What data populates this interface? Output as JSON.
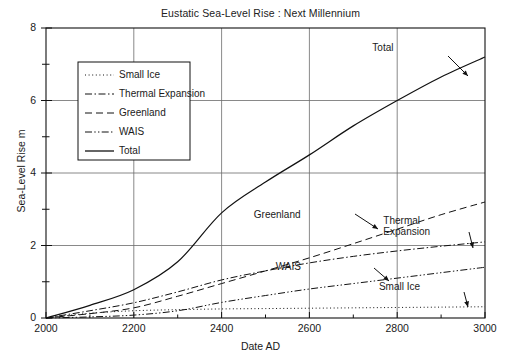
{
  "chart_data": {
    "type": "line",
    "title": "Eustatic Sea-Level Rise : Next Millennium",
    "xlabel": "Date  AD",
    "ylabel": "Sea-Level Rise  m",
    "xlim": [
      2000,
      3000
    ],
    "ylim": [
      0,
      8
    ],
    "xticks": [
      "2000",
      "2200",
      "2400",
      "2600",
      "2800",
      "3000"
    ],
    "yticks": [
      "0",
      "2",
      "4",
      "6",
      "8"
    ],
    "grid": "major-gridlines on both axes",
    "legend_position": "upper-left inside plot",
    "x": [
      2000,
      2100,
      2200,
      2300,
      2400,
      2500,
      2600,
      2700,
      2800,
      2900,
      3000
    ],
    "series": [
      {
        "name": "Small Ice",
        "style": "dotted",
        "values": [
          0,
          0.13,
          0.2,
          0.23,
          0.25,
          0.26,
          0.27,
          0.28,
          0.29,
          0.3,
          0.31
        ]
      },
      {
        "name": "Thermal Expansion",
        "style": "dash-dot",
        "values": [
          0,
          0.2,
          0.42,
          0.72,
          1.05,
          1.3,
          1.52,
          1.7,
          1.85,
          1.98,
          2.1
        ]
      },
      {
        "name": "Greenland",
        "style": "dashed",
        "values": [
          0,
          0.12,
          0.28,
          0.6,
          0.95,
          1.3,
          1.66,
          2.05,
          2.45,
          2.85,
          3.2
        ]
      },
      {
        "name": "WAIS",
        "style": "dash-dot-dot",
        "values": [
          0,
          0.03,
          0.08,
          0.2,
          0.43,
          0.62,
          0.8,
          0.95,
          1.1,
          1.25,
          1.4
        ]
      },
      {
        "name": "Total",
        "style": "solid",
        "values": [
          0,
          0.35,
          0.78,
          1.55,
          2.9,
          3.75,
          4.5,
          5.3,
          6.0,
          6.65,
          7.2
        ]
      }
    ],
    "annotations": [
      {
        "label": "Total",
        "x": 2830,
        "y": 7.45
      },
      {
        "label": "Greenland",
        "x": 2560,
        "y": 2.85
      },
      {
        "label": "Thermal\nExpansion",
        "x": 2855,
        "y": 2.68
      },
      {
        "label": "WAIS",
        "x": 2610,
        "y": 1.42
      },
      {
        "label": "Small Ice",
        "x": 2845,
        "y": 0.85
      }
    ]
  },
  "legend": {
    "items": [
      {
        "label": "Small Ice"
      },
      {
        "label": "Thermal Expansion"
      },
      {
        "label": "Greenland"
      },
      {
        "label": "WAIS"
      },
      {
        "label": "Total"
      }
    ]
  }
}
